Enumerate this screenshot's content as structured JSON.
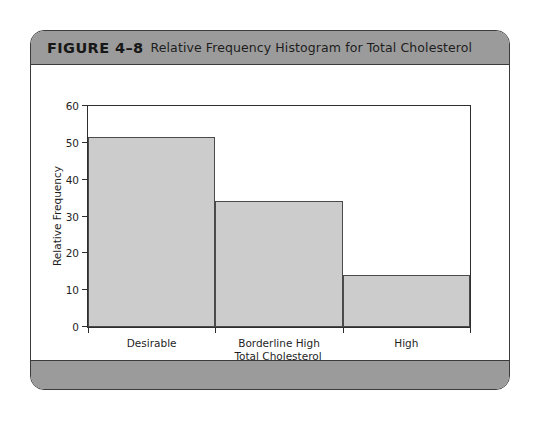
{
  "figure": {
    "number": "FIGURE 4–8",
    "caption": "Relative Frequency Histogram for Total Cholesterol",
    "header_color": "#9b9b9b",
    "border_color": "#3b3b3b"
  },
  "chart_data": {
    "type": "bar",
    "title": "Relative Frequency Histogram for Total Cholesterol",
    "categories": [
      "Desirable",
      "Borderline High",
      "High"
    ],
    "values": [
      51.5,
      34.3,
      14.2
    ],
    "xlabel": "Total Cholesterol",
    "ylabel": "Relative Frequency",
    "ylim": [
      0,
      60
    ],
    "yticks": [
      0,
      10,
      20,
      30,
      40,
      50,
      60
    ],
    "ytick_labels": [
      "0",
      "10",
      "20",
      "30",
      "40",
      "50",
      "60"
    ],
    "bar_fill": "#cccccc",
    "bar_edge": "#4a4a4a",
    "grid": false,
    "legend": null
  }
}
